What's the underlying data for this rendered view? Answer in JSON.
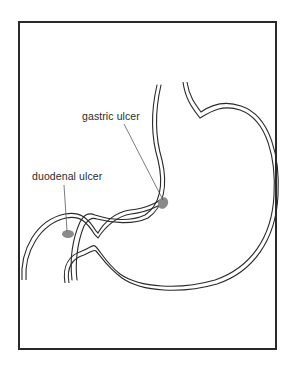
{
  "figure": {
    "type": "stomach-anatomy-diagram",
    "labels": {
      "gastric": "gastric ulcer",
      "duodenal": "duodenal ulcer"
    },
    "colors": {
      "outline": "#2a2a2a",
      "ulcer": "#8a8a8a",
      "background": "#ffffff"
    }
  }
}
